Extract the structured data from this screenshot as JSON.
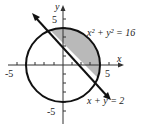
{
  "diagram": {
    "type": "region-graph",
    "axes": {
      "x_label": "x",
      "y_label": "y",
      "x_ticks": [
        "-5",
        "5"
      ],
      "y_ticks": [
        "5",
        "-5"
      ]
    },
    "curves": [
      {
        "name": "circle",
        "equation_label": "x² + y² = 16",
        "radius": 4
      },
      {
        "name": "line",
        "equation_label": "x + y = 2"
      }
    ],
    "shaded_region": "inside circle, above line x + y = 2",
    "colors": {
      "shade": "#b9b9b9",
      "stroke": "#111111"
    }
  }
}
